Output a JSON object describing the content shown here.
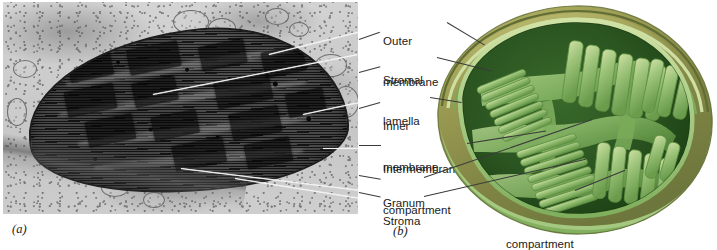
{
  "figure": {
    "panels": [
      {
        "tag": "(a)",
        "kind": "electron-micrograph",
        "subject": "chloroplast"
      },
      {
        "tag": "(b)",
        "kind": "illustration",
        "subject": "chloroplast cutaway"
      }
    ]
  },
  "labels": [
    {
      "id": "outer-membrane",
      "line1": "Outer",
      "line2": "membrane"
    },
    {
      "id": "stromal-lamella",
      "line1": "Stromal",
      "line2": "lamella"
    },
    {
      "id": "inner-membrane",
      "line1": "Inner",
      "line2": "membrane"
    },
    {
      "id": "intermembrane-compartment",
      "line1": "Intermembrane",
      "line2": "compartment"
    },
    {
      "id": "granum",
      "line1": "Granum",
      "line2": ""
    },
    {
      "id": "stroma",
      "line1": "Stroma",
      "line2": ""
    },
    {
      "id": "thylakoid-compartment",
      "line1": "Thylakoid",
      "line2": "compartment"
    }
  ],
  "panel_tags": {
    "a": "(a)",
    "b": "(b)"
  },
  "colors": {
    "outer_surface": "#8f9050",
    "outer_surface_light": "#b5b463",
    "membrane_light_green": "#a9cc86",
    "membrane_mid_green": "#7fae5c",
    "stroma_dark_green": "#2f5a23",
    "stroma_deep": "#1f4318",
    "thylakoid_edge": "#cfe0a4",
    "leader_line": "#3a3a3a",
    "leader_line_micrograph": "#f2f2f2",
    "text": "#1a1a1a",
    "micrograph_background": "#cdcdcd"
  }
}
